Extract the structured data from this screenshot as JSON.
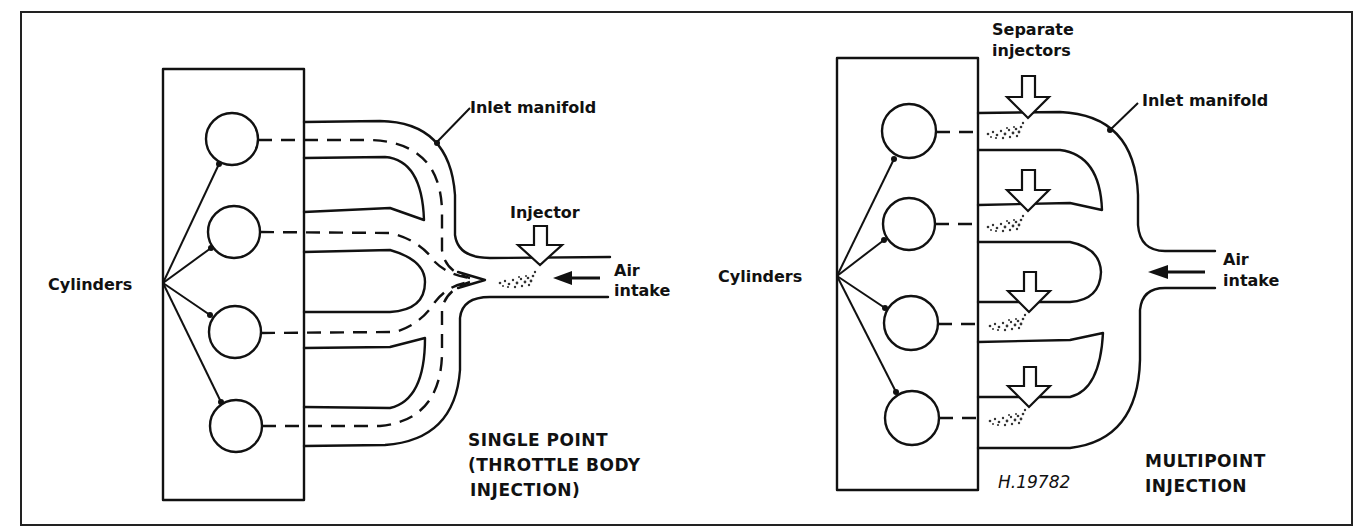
{
  "figure": {
    "border_color": "#222222",
    "figure_code": "H.19782"
  },
  "single_point": {
    "title_line1": "SINGLE POINT",
    "title_line2": "(THROTTLE BODY",
    "title_line3": " INJECTION)",
    "labels": {
      "cylinders": "Cylinders",
      "inlet_manifold": "Inlet manifold",
      "injector": "Injector",
      "air_line1": "Air",
      "air_line2": "intake"
    },
    "cylinder_count": 4
  },
  "multipoint": {
    "title_line1": "MULTIPOINT",
    "title_line2": "INJECTION",
    "labels": {
      "cylinders": "Cylinders",
      "inlet_manifold": "Inlet manifold",
      "separate_injectors_line1": "Separate",
      "separate_injectors_line2": "injectors",
      "air_line1": "Air",
      "air_line2": "intake"
    },
    "cylinder_count": 4,
    "injector_count": 4
  }
}
